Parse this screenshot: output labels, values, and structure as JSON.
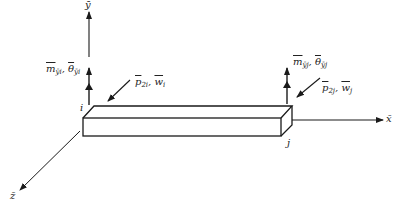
{
  "diagram": {
    "axes": {
      "x_label": "x̄",
      "y_label": "ȳ",
      "z_label": "z̄"
    },
    "nodes": {
      "i_label": "i",
      "j_label": "j"
    },
    "labels": {
      "moment_i": {
        "sym": "m",
        "sub": "ȳi",
        "sep": ", ",
        "sym2": "θ",
        "sub2": "ȳi"
      },
      "load_i": {
        "sym": "p",
        "sub": "2i",
        "sep": ", ",
        "sym2": "w",
        "sub2": "i"
      },
      "moment_j": {
        "sym": "m",
        "sub": "ȳj",
        "sep": ", ",
        "sym2": "θ",
        "sub2": "ȳj"
      },
      "load_j": {
        "sym": "p",
        "sub": "2j",
        "sep": ", ",
        "sym2": "w",
        "sub2": "j"
      }
    },
    "colors": {
      "line": "#1a1a1a",
      "background": "#ffffff"
    }
  }
}
